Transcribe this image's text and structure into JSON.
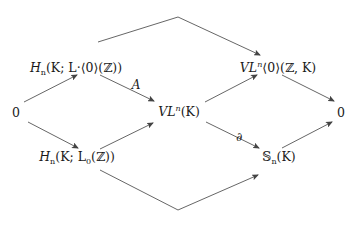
{
  "diagram": {
    "type": "commutative-diagram",
    "nodes": {
      "zero_left": {
        "text": "0"
      },
      "h_upper": {
        "H": "H",
        "n": "n",
        "rest": "(K; L·⟨0⟩(ℤ))"
      },
      "vl_upper": {
        "V": "V",
        "L": "L",
        "n": "n",
        "rest": "⟨0⟩(ℤ, K)"
      },
      "vl_mid": {
        "V": "V",
        "L": "L",
        "n": "n",
        "rest": "(K)"
      },
      "h_lower": {
        "H": "H",
        "n": "n",
        "rest1": "(K; L",
        "zero": "0",
        "rest2": "(ℤ))"
      },
      "s_lower": {
        "S": "𝕊",
        "n": "n",
        "rest": "(K)"
      },
      "zero_right": {
        "text": "0"
      }
    },
    "edge_labels": {
      "A": "A",
      "partial": "∂"
    },
    "edges": [
      {
        "from": "zero_left",
        "to": "h_upper"
      },
      {
        "from": "zero_left",
        "to": "h_lower"
      },
      {
        "from": "h_upper",
        "to": "vl_mid",
        "label": "A"
      },
      {
        "from": "h_lower",
        "to": "vl_mid"
      },
      {
        "from": "vl_mid",
        "to": "vl_upper"
      },
      {
        "from": "vl_mid",
        "to": "s_lower",
        "label": "∂"
      },
      {
        "from": "h_upper",
        "to": "vl_upper",
        "route": "over-top"
      },
      {
        "from": "h_lower",
        "to": "s_lower",
        "route": "under-bottom"
      },
      {
        "from": "vl_upper",
        "to": "zero_right"
      },
      {
        "from": "s_lower",
        "to": "zero_right"
      }
    ],
    "colors": {
      "stroke": "#555555",
      "text": "#1a1a1a",
      "background": "#ffffff"
    }
  }
}
